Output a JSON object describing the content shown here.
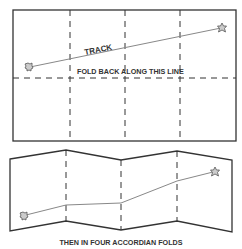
{
  "top_panel": {
    "track_label": "TRACK",
    "fold_label": "FOLD BACK ALONG THIS LINE",
    "rect": {
      "x": 13,
      "y": 10,
      "w": 223,
      "h": 131
    },
    "vertical_folds_x": [
      70,
      125,
      180
    ],
    "horizontal_fold_y": 78,
    "track": {
      "start": [
        30,
        67
      ],
      "end": [
        221,
        28
      ]
    }
  },
  "bottom_panel": {
    "caption": "THEN IN FOUR ACCORDIAN FOLDS",
    "fold_xs": [
      10,
      66,
      121,
      177,
      232
    ],
    "top_ys": [
      159,
      150,
      160,
      151,
      160
    ],
    "bottom_ys": [
      231,
      221,
      230,
      221,
      232
    ],
    "track_points": [
      [
        24,
        216
      ],
      [
        66,
        205
      ],
      [
        121,
        203
      ],
      [
        177,
        181
      ],
      [
        214,
        172
      ]
    ]
  },
  "colors": {
    "line": "#333333",
    "track": "#888888",
    "marker": "#666666"
  },
  "icons": {
    "start_marker": "star-blob-icon",
    "end_marker": "star-blob-icon"
  }
}
